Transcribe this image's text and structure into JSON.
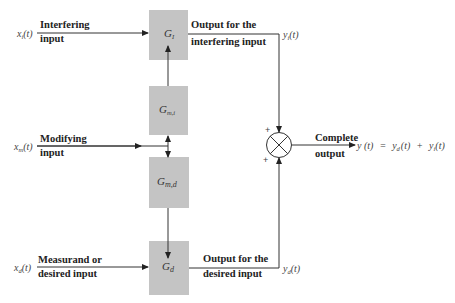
{
  "inputs": {
    "interfering": {
      "var": "x",
      "sub": "i",
      "arg": "(t)",
      "label_line1": "Interfering",
      "label_line2": "input"
    },
    "modifying": {
      "var": "x",
      "sub": "m",
      "arg": "(t)",
      "label_line1": "Modifying",
      "label_line2": "input"
    },
    "desired": {
      "var": "x",
      "sub": "d",
      "arg": "(t)",
      "label_line1": "Measurand or",
      "label_line2": "desired input"
    }
  },
  "blocks": {
    "g_i": {
      "symbol": "G",
      "sub": "I"
    },
    "g_mi": {
      "symbol": "G",
      "sub": "m,i"
    },
    "g_md": {
      "symbol": "G",
      "sub": "m,d"
    },
    "g_d": {
      "symbol": "G",
      "sub": "d"
    }
  },
  "outputs": {
    "interfering": {
      "label_line1": "Output for the",
      "label_line2": "interfering input",
      "var": "y",
      "sub": "i",
      "arg": "(t)"
    },
    "desired": {
      "label_line1": "Output for the",
      "label_line2": "desired input",
      "var": "y",
      "sub": "d",
      "arg": "(t)"
    }
  },
  "summing_junction": {
    "sign_top": "+",
    "sign_bottom": "+"
  },
  "complete_output": {
    "label_line1": "Complete",
    "label_line2": "output",
    "formula_lhs": "y (t)",
    "eq": "=",
    "term1_var": "y",
    "term1_sub": "d",
    "term1_arg": "(t)",
    "plus": "+",
    "term2_var": "y",
    "term2_sub": "i",
    "term2_arg": "(t)"
  }
}
